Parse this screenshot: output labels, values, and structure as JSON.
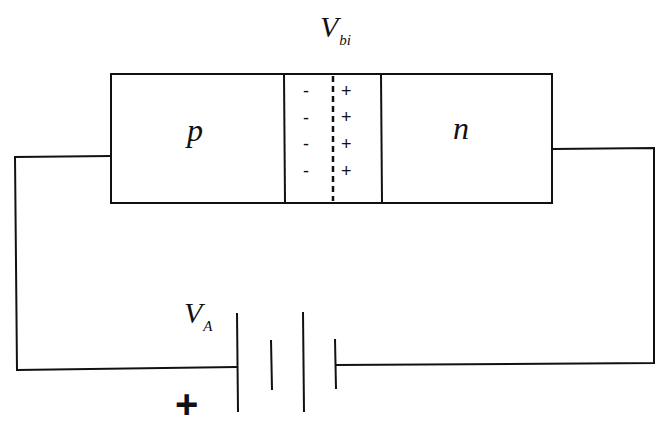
{
  "diagram": {
    "type": "pn-junction-circuit",
    "labels": {
      "builtin_voltage": {
        "main": "V",
        "sub": "bi"
      },
      "applied_voltage": {
        "main": "V",
        "sub": "A"
      },
      "p_region": "p",
      "n_region": "n",
      "battery_polarity": "+"
    },
    "depletion_region": {
      "negative_charges": [
        "-",
        "-",
        "-",
        "-"
      ],
      "positive_charges": [
        "+",
        "+",
        "+",
        "+"
      ]
    },
    "colors": {
      "line": "#111111",
      "background": "#ffffff"
    }
  }
}
